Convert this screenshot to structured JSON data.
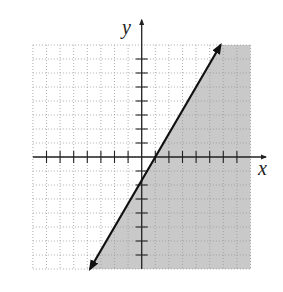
{
  "chart_data": {
    "type": "line",
    "title": "",
    "xlabel": "x",
    "ylabel": "y",
    "xlim": [
      -8,
      8
    ],
    "ylim": [
      -8,
      8
    ],
    "grid": true,
    "grid_style": "dotted",
    "x_ticks": [
      -7,
      -6,
      -5,
      -4,
      -3,
      -2,
      -1,
      1,
      2,
      3,
      4,
      5,
      6,
      7
    ],
    "y_ticks": [
      -7,
      -6,
      -5,
      -4,
      -3,
      -2,
      -1,
      1,
      2,
      3,
      4,
      5,
      6,
      7
    ],
    "tick_labels_shown": false,
    "series": [
      {
        "name": "boundary line",
        "equation": "y = (5/3)x - 5/3",
        "style": "solid",
        "arrows": "both",
        "points": [
          [
            -3.8,
            -8
          ],
          [
            -2,
            -5
          ],
          [
            1,
            0
          ],
          [
            4,
            5
          ],
          [
            5.8,
            8
          ]
        ]
      }
    ],
    "shaded_region": {
      "inequality": "y <= (5/3)x - 5/3",
      "side": "below-right of line",
      "color": "#c9c9c9"
    },
    "colors": {
      "axis": "#222222",
      "line": "#111111",
      "grid": "#9a9a9a",
      "shade": "#c9c9c9"
    }
  },
  "labels": {
    "x_axis": "x",
    "y_axis": "y"
  }
}
